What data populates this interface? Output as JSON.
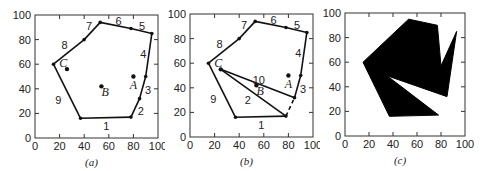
{
  "figure": {
    "panels": [
      {
        "id": "a",
        "caption": "(a)",
        "axis": {
          "xticks": [
            "0",
            "20",
            "40",
            "60",
            "80",
            "100"
          ],
          "yticks": [
            "0",
            "20",
            "40",
            "60",
            "80",
            "100"
          ],
          "xlim": [
            0,
            100
          ],
          "ylim": [
            0,
            100
          ]
        },
        "polygon": [
          [
            37,
            16
          ],
          [
            78,
            17
          ],
          [
            85,
            32
          ],
          [
            90,
            50
          ],
          [
            95,
            85
          ],
          [
            78,
            89
          ],
          [
            53,
            94
          ],
          [
            40,
            80
          ],
          [
            15,
            60
          ]
        ],
        "edge_labels": [
          {
            "text": "1",
            "x": 58,
            "y": 10
          },
          {
            "text": "2",
            "x": 86,
            "y": 22
          },
          {
            "text": "3",
            "x": 92,
            "y": 39
          },
          {
            "text": "4",
            "x": 88,
            "y": 68
          },
          {
            "text": "5",
            "x": 87,
            "y": 91
          },
          {
            "text": "6",
            "x": 68,
            "y": 95
          },
          {
            "text": "7",
            "x": 44,
            "y": 91
          },
          {
            "text": "8",
            "x": 24,
            "y": 76
          },
          {
            "text": "9",
            "x": 19,
            "y": 31
          }
        ],
        "points": [
          {
            "label": "A",
            "x": 80,
            "y": 50,
            "lx": 80,
            "ly": 43
          },
          {
            "label": "B",
            "x": 54,
            "y": 42,
            "lx": 57,
            "ly": 37
          },
          {
            "label": "C",
            "x": 26,
            "y": 56,
            "lx": 23,
            "ly": 61
          }
        ]
      },
      {
        "id": "b",
        "caption": "(b)",
        "axis": {
          "xticks": [
            "0",
            "20",
            "40",
            "60",
            "80",
            "100"
          ],
          "yticks": [
            "0",
            "20",
            "40",
            "60",
            "80",
            "100"
          ],
          "xlim": [
            0,
            100
          ],
          "ylim": [
            0,
            100
          ]
        },
        "polygon": [
          [
            37,
            16
          ],
          [
            78,
            17
          ],
          [
            85,
            32
          ],
          [
            90,
            50
          ],
          [
            95,
            85
          ],
          [
            78,
            89
          ],
          [
            53,
            94
          ],
          [
            40,
            80
          ],
          [
            15,
            60
          ]
        ],
        "interior_edges": [
          {
            "from": [
              25,
              55
            ],
            "to": [
              78,
              17
            ]
          },
          {
            "from": [
              25,
              55
            ],
            "to": [
              85,
              32
            ]
          }
        ],
        "dashed_edge": {
          "from": [
            78,
            17
          ],
          "to": [
            85,
            32
          ]
        },
        "edge_labels": [
          {
            "text": "1",
            "x": 58,
            "y": 10
          },
          {
            "text": "2",
            "x": 47,
            "y": 30
          },
          {
            "text": "3",
            "x": 92,
            "y": 39
          },
          {
            "text": "4",
            "x": 88,
            "y": 68
          },
          {
            "text": "5",
            "x": 87,
            "y": 91
          },
          {
            "text": "6",
            "x": 68,
            "y": 95
          },
          {
            "text": "7",
            "x": 44,
            "y": 91
          },
          {
            "text": "8",
            "x": 24,
            "y": 76
          },
          {
            "text": "9",
            "x": 19,
            "y": 31
          },
          {
            "text": "10",
            "x": 56,
            "y": 46
          }
        ],
        "points": [
          {
            "label": "A",
            "x": 80,
            "y": 50,
            "lx": 80,
            "ly": 43
          },
          {
            "label": "B",
            "x": 54,
            "y": 42,
            "lx": 57,
            "ly": 37
          },
          {
            "label": "C",
            "x": 25,
            "y": 55,
            "lx": 23,
            "ly": 60
          }
        ]
      },
      {
        "id": "c",
        "caption": "(c)",
        "axis": {
          "xticks": [
            "0",
            "20",
            "40",
            "60",
            "80",
            "100"
          ],
          "yticks": [
            "0",
            "20",
            "40",
            "60",
            "80",
            "100"
          ],
          "xlim": [
            0,
            100
          ],
          "ylim": [
            0,
            100
          ]
        },
        "filled_polygon": [
          [
            15,
            60
          ],
          [
            53,
            95
          ],
          [
            77,
            90
          ],
          [
            80,
            57
          ],
          [
            93,
            85
          ],
          [
            85,
            32
          ],
          [
            35,
            49
          ],
          [
            78,
            17
          ],
          [
            37,
            16
          ]
        ]
      }
    ]
  }
}
